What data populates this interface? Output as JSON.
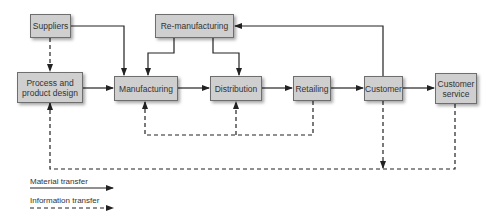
{
  "diagram": {
    "type": "flowchart",
    "nodes": {
      "suppliers": "Suppliers",
      "process_design": "Process and product design",
      "manufacturing": "Manufacturing",
      "remanufacturing": "Re-manufacturing",
      "distribution": "Distribution",
      "retailing": "Retailing",
      "customer": "Customer",
      "customer_service": "Customer service"
    },
    "edges": [
      {
        "from": "suppliers",
        "to": "manufacturing",
        "kind": "material"
      },
      {
        "from": "suppliers",
        "to": "process_design",
        "kind": "information"
      },
      {
        "from": "process_design",
        "to": "manufacturing",
        "kind": "material"
      },
      {
        "from": "remanufacturing",
        "to": "manufacturing",
        "kind": "material"
      },
      {
        "from": "remanufacturing",
        "to": "distribution",
        "kind": "material"
      },
      {
        "from": "manufacturing",
        "to": "distribution",
        "kind": "material"
      },
      {
        "from": "distribution",
        "to": "retailing",
        "kind": "material"
      },
      {
        "from": "retailing",
        "to": "customer",
        "kind": "material"
      },
      {
        "from": "customer",
        "to": "customer_service",
        "kind": "material"
      },
      {
        "from": "customer",
        "to": "remanufacturing",
        "kind": "material"
      },
      {
        "from": "retailing",
        "to": "manufacturing",
        "kind": "information"
      },
      {
        "from": "retailing",
        "to": "distribution",
        "kind": "information"
      },
      {
        "from": "customer_service",
        "to": "process_design",
        "kind": "information"
      },
      {
        "from": "customer",
        "to": "bottom-feedback-line",
        "kind": "information"
      }
    ],
    "legend": {
      "material": "Material transfer",
      "information": "Information transfer"
    }
  }
}
